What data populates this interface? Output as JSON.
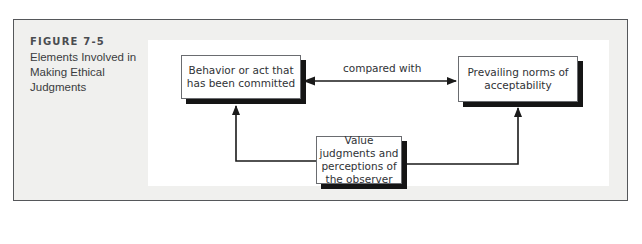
{
  "figure": {
    "number": "FIGURE 7-5",
    "title": "Elements Involved in Making Ethical Judgments"
  },
  "diagram": {
    "nodes": [
      {
        "id": "behavior",
        "label": "Behavior or act that has been committed"
      },
      {
        "id": "norms",
        "label": "Prevailing norms of acceptability"
      },
      {
        "id": "observer",
        "label": "Value judgments and perceptions of the observer"
      }
    ],
    "edges": [
      {
        "from": "behavior",
        "to": "norms",
        "label": "compared with",
        "bidirectional": true
      },
      {
        "from": "observer",
        "to": "behavior",
        "label": ""
      },
      {
        "from": "observer",
        "to": "norms",
        "label": ""
      }
    ]
  },
  "colors": {
    "frame_border": "#55575a",
    "frame_fill": "#f0f0ee",
    "box_shadow": "#151515",
    "line": "#1a1a1a",
    "text": "#303236"
  }
}
